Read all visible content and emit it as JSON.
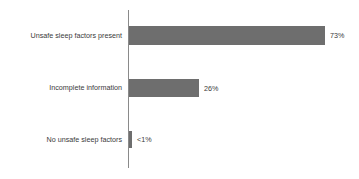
{
  "chart_data": {
    "type": "bar",
    "orientation": "horizontal",
    "title": "",
    "subtitle": "",
    "xlabel": "",
    "ylabel": "",
    "grid": false,
    "legend": null,
    "axis_range": [
      0,
      100
    ],
    "axis_visible": {
      "category_axis_line": true,
      "value_axis_line": false
    },
    "categories": [
      "Unsafe sleep factors present",
      "Incomplete information",
      "No unsafe sleep factors"
    ],
    "values": [
      73,
      26,
      0.5
    ],
    "value_labels": [
      "73%",
      "26%",
      "<1%"
    ],
    "colors": {
      "bar": "#6e6e6e",
      "text": "#3a3a3a",
      "axis": "#8a8a8a",
      "background": "#ffffff"
    }
  },
  "bars": [
    {
      "category": "Unsafe sleep factors present",
      "value": 73,
      "value_label": "73%"
    },
    {
      "category": "Incomplete information",
      "value": 26,
      "value_label": "26%"
    },
    {
      "category": "No unsafe sleep factors",
      "value": 0.5,
      "value_label": "<1%"
    }
  ]
}
